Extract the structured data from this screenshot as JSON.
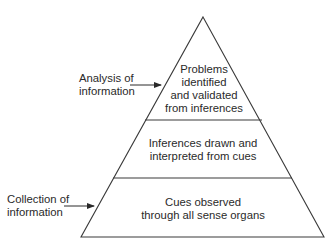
{
  "diagram": {
    "type": "pyramid",
    "levels": [
      {
        "lines": [
          "Problems",
          "identified",
          "and validated",
          "from inferences"
        ]
      },
      {
        "lines": [
          "Inferences drawn and",
          "interpreted from cues"
        ]
      },
      {
        "lines": [
          "Cues observed",
          "through all sense organs"
        ]
      }
    ],
    "annotations": [
      {
        "lines": [
          "Analysis of",
          "information"
        ],
        "points_to_level": 0
      },
      {
        "lines": [
          "Collection of",
          "information"
        ],
        "points_to_level": 2
      }
    ]
  },
  "colors": {
    "stroke": "#3a3a3a",
    "background": "#ffffff",
    "text": "#2a2a2a"
  }
}
